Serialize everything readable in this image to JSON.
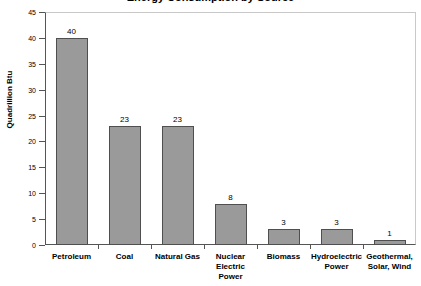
{
  "chart_data": {
    "type": "bar",
    "title": "",
    "xlabel": "",
    "ylabel": "Quadrillion Btu",
    "ylim": [
      0,
      45
    ],
    "ytick_values": [
      0,
      5,
      10,
      15,
      20,
      25,
      30,
      35,
      40,
      45
    ],
    "ytick_labels": [
      "0",
      "5",
      "10",
      "15",
      "20",
      "25",
      "30",
      "35",
      "40",
      "45"
    ],
    "grid": false,
    "legend": "none",
    "bar_color": "#9a9a9a",
    "bar_border_color": "#4f4f4f",
    "categories": [
      "Petroleum",
      "Coal",
      "Natural Gas",
      "Nuclear\nElectric Power",
      "Biomass",
      "Hydroelectric\nPower",
      "Geothermal,\nSolar, Wind"
    ],
    "category_lines": [
      [
        "Petroleum"
      ],
      [
        "Coal"
      ],
      [
        "Natural Gas"
      ],
      [
        "Nuclear",
        "Electric Power"
      ],
      [
        "Biomass"
      ],
      [
        "Hydroelectric",
        "Power"
      ],
      [
        "Geothermal,",
        "Solar, Wind"
      ]
    ],
    "values": [
      40,
      23,
      23,
      8,
      3,
      3,
      1
    ],
    "value_labels": [
      "40",
      "23",
      "23",
      "8",
      "3",
      "3",
      "1"
    ]
  },
  "axis": {
    "y_title": "Quadrillion Btu"
  },
  "title_strip": {
    "text": "Energy Consumption by Source"
  }
}
